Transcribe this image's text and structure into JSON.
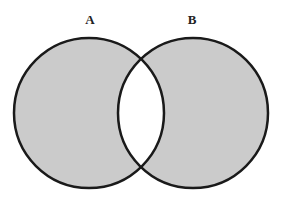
{
  "diagram": {
    "type": "venn",
    "sets": [
      {
        "label": "A",
        "cx": 89,
        "cy": 113,
        "r": 75
      },
      {
        "label": "B",
        "cx": 193,
        "cy": 113,
        "r": 75
      }
    ],
    "shaded_regions": [
      "A only",
      "B only"
    ],
    "unshaded_regions": [
      "A ∩ B"
    ],
    "colors": {
      "fill": "#cbcbcb",
      "stroke": "#1a1a1a",
      "intersection": "#ffffff"
    }
  }
}
